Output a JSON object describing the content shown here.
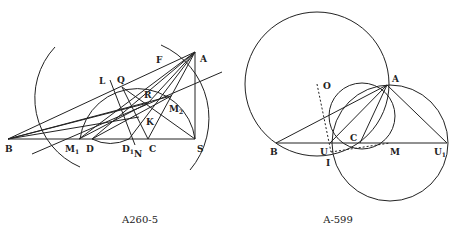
{
  "figures": [
    {
      "caption": "A260-5",
      "caption_pos": [
        140,
        223
      ],
      "points": {
        "A": [
          195,
          52
        ],
        "B": [
          8,
          139
        ],
        "S": [
          195,
          139
        ],
        "M1": [
          79,
          139
        ],
        "D": [
          92,
          139
        ],
        "D1": [
          129,
          139
        ],
        "C": [
          148,
          139
        ],
        "N": [
          135,
          145
        ],
        "L": [
          110,
          80
        ],
        "Q": [
          122,
          87
        ],
        "F": [
          165,
          60
        ],
        "R": [
          148,
          103
        ],
        "K": [
          139,
          117
        ],
        "M2": [
          171,
          96
        ]
      },
      "labels": [
        {
          "text": "A",
          "x": 200,
          "y": 62
        },
        {
          "text": "B",
          "x": 5,
          "y": 152
        },
        {
          "text": "S",
          "x": 197,
          "y": 152
        },
        {
          "text": "M",
          "sub": "1",
          "x": 65,
          "y": 152
        },
        {
          "text": "D",
          "x": 86,
          "y": 152
        },
        {
          "text": "D",
          "sub": "1",
          "x": 122,
          "y": 152
        },
        {
          "text": "N",
          "x": 134,
          "y": 157
        },
        {
          "text": "C",
          "x": 149,
          "y": 152
        },
        {
          "text": "L",
          "x": 99,
          "y": 84
        },
        {
          "text": "Q",
          "x": 117,
          "y": 83
        },
        {
          "text": "F",
          "x": 156,
          "y": 63
        },
        {
          "text": "R",
          "x": 144,
          "y": 98
        },
        {
          "text": "K",
          "x": 146,
          "y": 125
        },
        {
          "text": "M",
          "sub": "2",
          "x": 169,
          "y": 112
        }
      ],
      "segments": [
        [
          8,
          139,
          195,
          139
        ],
        [
          195,
          52,
          195,
          139
        ],
        [
          8,
          139,
          195,
          52
        ],
        [
          8,
          139,
          171,
          96
        ],
        [
          8,
          139,
          148,
          103
        ],
        [
          8,
          139,
          139,
          117
        ],
        [
          32,
          154,
          222,
          72
        ],
        [
          195,
          52,
          79,
          139
        ],
        [
          195,
          52,
          92,
          139
        ],
        [
          195,
          52,
          129,
          139
        ],
        [
          195,
          52,
          148,
          139
        ],
        [
          195,
          52,
          148,
          103
        ],
        [
          122,
          87,
          195,
          139
        ],
        [
          122,
          87,
          148,
          139
        ],
        [
          110,
          80,
          135,
          145
        ],
        [
          92,
          139,
          171,
          96
        ],
        [
          79,
          139,
          148,
          103
        ]
      ],
      "arcs": [
        "M55 47 A75 75 0 0 0 80 167",
        "M161 45 A80 80 0 0 1 190 170",
        "M80 139 A58 58 0 0 1 195 139",
        "M92 139 Q110 148 129 139"
      ],
      "dotted": []
    },
    {
      "caption": "A-599",
      "caption_pos": [
        338,
        223
      ],
      "points": {
        "A": [
          387,
          85
        ],
        "B": [
          276,
          143
        ],
        "U": [
          330,
          143
        ],
        "C": [
          360,
          143
        ],
        "M": [
          390,
          143
        ],
        "U1": [
          447,
          143
        ],
        "I": [
          331,
          152
        ],
        "O": [
          317,
          84
        ]
      },
      "labels": [
        {
          "text": "A",
          "x": 392,
          "y": 82
        },
        {
          "text": "O",
          "x": 323,
          "y": 89
        },
        {
          "text": "B",
          "x": 270,
          "y": 155
        },
        {
          "text": "U",
          "x": 320,
          "y": 155
        },
        {
          "text": "C",
          "x": 350,
          "y": 141
        },
        {
          "text": "M",
          "x": 390,
          "y": 155
        },
        {
          "text": "U",
          "sub": "1",
          "x": 434,
          "y": 155
        },
        {
          "text": "I",
          "x": 326,
          "y": 166
        }
      ],
      "segments": [
        [
          276,
          143,
          447,
          143
        ],
        [
          276,
          143,
          387,
          85
        ],
        [
          330,
          143,
          387,
          85
        ],
        [
          360,
          143,
          387,
          85
        ],
        [
          387,
          85,
          447,
          143
        ]
      ],
      "circles": [
        {
          "cx": 317,
          "cy": 84,
          "r": 72
        },
        {
          "cx": 390,
          "cy": 143,
          "r": 58
        },
        {
          "cx": 362,
          "cy": 116,
          "r": 33
        }
      ],
      "dotted": [
        [
          317,
          84,
          331,
          152
        ],
        [
          331,
          152,
          390,
          143
        ]
      ]
    }
  ]
}
